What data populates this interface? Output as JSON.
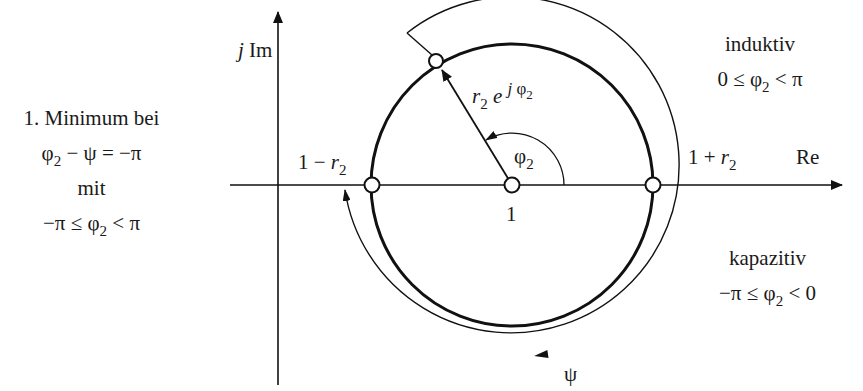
{
  "diagram": {
    "type": "complex-plane circle diagram",
    "axes": {
      "imaginary_label_j": "j",
      "imaginary_label": "Im",
      "real_label": "Re"
    },
    "points": {
      "center_label": "1",
      "left_prefix": "1 − ",
      "left_var": "r",
      "left_sub": "2",
      "right_prefix": "1 + ",
      "right_var": "r",
      "right_sub": "2"
    },
    "vector": {
      "r": "r",
      "r_sub": "2",
      "e": "e",
      "exp_j": "j",
      "exp_phi": "φ",
      "exp_sub": "2"
    },
    "angle": {
      "phi": "φ",
      "phi_sub": "2"
    },
    "sweep": {
      "psi": "ψ"
    },
    "left_note": {
      "line1": "1. Minimum bei",
      "line2_phi": "φ",
      "line2_sub": "2",
      "line2_rest": " − ψ = −π",
      "line3": "mit",
      "line4_pre": "−π ≤ φ",
      "line4_sub": "2",
      "line4_post": " < π"
    },
    "inductive": {
      "title": "induktiv",
      "cond_pre": "0 ≤ φ",
      "cond_sub": "2",
      "cond_post": " < π"
    },
    "capacitive": {
      "title": "kapazitiv",
      "cond_pre": "−π ≤ φ",
      "cond_sub": "2",
      "cond_post": " < 0"
    }
  }
}
